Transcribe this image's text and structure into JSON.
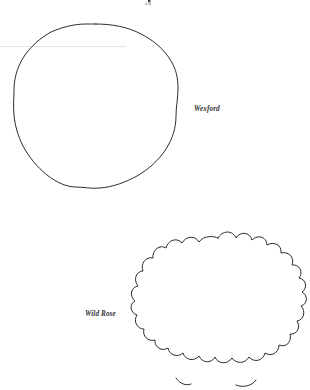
{
  "page": {
    "background_color": "#ffffff",
    "ink_color": "#2b2b2b",
    "scan_rule_color": "#e3e3e6",
    "width": 310,
    "height": 390
  },
  "figures": [
    {
      "id": "wexford",
      "label": "Wexford",
      "shape_kind": "circle-outline",
      "description": "hand-drawn slightly irregular circle outline",
      "center": {
        "x": 96,
        "y": 106
      },
      "radius": 82,
      "lobes": 0
    },
    {
      "id": "wild-rose",
      "label": "Wild Rose",
      "shape_kind": "scalloped-circle-outline",
      "description": "hand-drawn scalloped rosette outline, cropped at bottom edge",
      "center": {
        "x": 218,
        "y": 318
      },
      "radius": 80,
      "lobes": 20
    }
  ],
  "labels": {
    "wexford": "Wexford",
    "wild_rose": "Wild Rose"
  },
  "artifacts": {
    "scan_rule": {
      "name": "faint-horizontal-scan-line",
      "x1": 0,
      "x2": 126,
      "y": 46
    },
    "top_crop_mark": {
      "name": "cropped-text-fragment",
      "x": 146,
      "y": 0
    }
  }
}
